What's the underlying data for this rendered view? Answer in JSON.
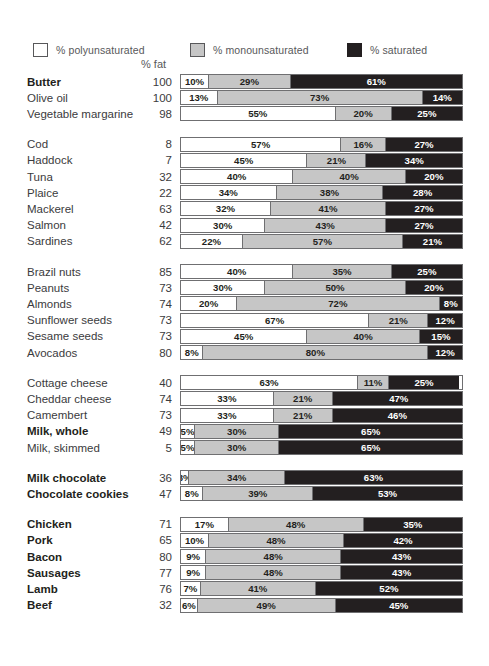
{
  "legend": {
    "items": [
      {
        "key": "poly",
        "label": "% polyunsaturated",
        "color": "#ffffff",
        "icon": "legend-swatch-white"
      },
      {
        "key": "mono",
        "label": "% monounsaturated",
        "color": "#c6c6c6",
        "icon": "legend-swatch-grey"
      },
      {
        "key": "sat",
        "label": "% saturated",
        "color": "#231f20",
        "icon": "legend-swatch-black"
      }
    ]
  },
  "header": {
    "fat_column_label": "% fat"
  },
  "chart_data": {
    "type": "bar",
    "orientation": "horizontal",
    "stacked": true,
    "normalized": true,
    "title": "",
    "xlabel": "",
    "ylabel": "",
    "xlim": [
      0,
      100
    ],
    "grid": false,
    "legend_position": "top",
    "value_suffix": "%",
    "series": [
      {
        "name": "% polyunsaturated",
        "key": "poly",
        "color": "#ffffff"
      },
      {
        "name": "% monounsaturated",
        "key": "mono",
        "color": "#c6c6c6"
      },
      {
        "name": "% saturated",
        "key": "sat",
        "color": "#231f20"
      }
    ],
    "extra_columns": [
      {
        "name": "% fat",
        "key": "fat"
      }
    ],
    "groups": [
      {
        "name": "fats-and-oils",
        "rows": [
          {
            "label": "Butter",
            "bold": true,
            "fat": 100,
            "poly": 10,
            "mono": 29,
            "sat": 61
          },
          {
            "label": "Olive oil",
            "bold": false,
            "fat": 100,
            "poly": 13,
            "mono": 73,
            "sat": 14
          },
          {
            "label": "Vegetable margarine",
            "bold": false,
            "fat": 98,
            "poly": 55,
            "mono": 20,
            "sat": 25
          }
        ]
      },
      {
        "name": "fish",
        "rows": [
          {
            "label": "Cod",
            "bold": false,
            "fat": 8,
            "poly": 57,
            "mono": 16,
            "sat": 27
          },
          {
            "label": "Haddock",
            "bold": false,
            "fat": 7,
            "poly": 45,
            "mono": 21,
            "sat": 34
          },
          {
            "label": "Tuna",
            "bold": false,
            "fat": 32,
            "poly": 40,
            "mono": 40,
            "sat": 20
          },
          {
            "label": "Plaice",
            "bold": false,
            "fat": 22,
            "poly": 34,
            "mono": 38,
            "sat": 28
          },
          {
            "label": "Mackerel",
            "bold": false,
            "fat": 63,
            "poly": 32,
            "mono": 41,
            "sat": 27
          },
          {
            "label": "Salmon",
            "bold": false,
            "fat": 42,
            "poly": 30,
            "mono": 43,
            "sat": 27
          },
          {
            "label": "Sardines",
            "bold": false,
            "fat": 62,
            "poly": 22,
            "mono": 57,
            "sat": 21
          }
        ]
      },
      {
        "name": "nuts-seeds-avocado",
        "rows": [
          {
            "label": "Brazil nuts",
            "bold": false,
            "fat": 85,
            "poly": 40,
            "mono": 35,
            "sat": 25
          },
          {
            "label": "Peanuts",
            "bold": false,
            "fat": 73,
            "poly": 30,
            "mono": 50,
            "sat": 20
          },
          {
            "label": "Almonds",
            "bold": false,
            "fat": 74,
            "poly": 20,
            "mono": 72,
            "sat": 8
          },
          {
            "label": "Sunflower seeds",
            "bold": false,
            "fat": 73,
            "poly": 67,
            "mono": 21,
            "sat": 12
          },
          {
            "label": "Sesame seeds",
            "bold": false,
            "fat": 73,
            "poly": 45,
            "mono": 40,
            "sat": 15
          },
          {
            "label": "Avocados",
            "bold": false,
            "fat": 80,
            "poly": 8,
            "mono": 80,
            "sat": 12
          }
        ]
      },
      {
        "name": "dairy",
        "rows": [
          {
            "label": "Cottage cheese",
            "bold": false,
            "fat": 40,
            "poly": 63,
            "mono": 11,
            "sat": 25
          },
          {
            "label": "Cheddar cheese",
            "bold": false,
            "fat": 74,
            "poly": 33,
            "mono": 21,
            "sat": 47
          },
          {
            "label": "Camembert",
            "bold": false,
            "fat": 73,
            "poly": 33,
            "mono": 21,
            "sat": 46
          },
          {
            "label": "Milk, whole",
            "bold": true,
            "fat": 49,
            "poly": 5,
            "mono": 30,
            "sat": 65
          },
          {
            "label": "Milk, skimmed",
            "bold": false,
            "fat": 5,
            "poly": 5,
            "mono": 30,
            "sat": 65
          }
        ]
      },
      {
        "name": "confectionery",
        "rows": [
          {
            "label": "Milk chocolate",
            "bold": true,
            "fat": 36,
            "poly": 3,
            "mono": 34,
            "sat": 63
          },
          {
            "label": "Chocolate cookies",
            "bold": true,
            "fat": 47,
            "poly": 8,
            "mono": 39,
            "sat": 53
          }
        ]
      },
      {
        "name": "meat",
        "rows": [
          {
            "label": "Chicken",
            "bold": true,
            "fat": 71,
            "poly": 17,
            "mono": 48,
            "sat": 35
          },
          {
            "label": "Pork",
            "bold": true,
            "fat": 65,
            "poly": 10,
            "mono": 48,
            "sat": 42
          },
          {
            "label": "Bacon",
            "bold": true,
            "fat": 80,
            "poly": 9,
            "mono": 48,
            "sat": 43
          },
          {
            "label": "Sausages",
            "bold": true,
            "fat": 77,
            "poly": 9,
            "mono": 48,
            "sat": 43
          },
          {
            "label": "Lamb",
            "bold": true,
            "fat": 76,
            "poly": 7,
            "mono": 41,
            "sat": 52
          },
          {
            "label": "Beef",
            "bold": true,
            "fat": 32,
            "poly": 6,
            "mono": 49,
            "sat": 45
          }
        ]
      }
    ]
  }
}
